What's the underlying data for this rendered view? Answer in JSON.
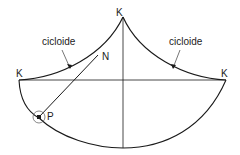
{
  "diagram": {
    "labels": {
      "cusp_top": "K",
      "cusp_left": "K",
      "cusp_right": "K",
      "point_n": "N",
      "point_p": "P",
      "curve_left": "cicloide",
      "curve_right": "cicloide"
    },
    "colors": {
      "stroke": "#1a1a1a",
      "background": "#ffffff"
    }
  }
}
